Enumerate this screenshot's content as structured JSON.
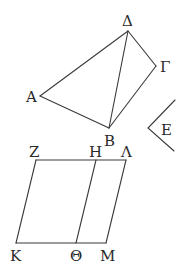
{
  "figure": {
    "top": {
      "points": {
        "A": {
          "x": 40,
          "y": 96,
          "label": "Α",
          "lx": 26,
          "ly": 102
        },
        "B": {
          "x": 109,
          "y": 128,
          "label": "Β",
          "lx": 104,
          "ly": 146
        },
        "G": {
          "x": 156,
          "y": 66,
          "label": "Γ",
          "lx": 160,
          "ly": 72
        },
        "D": {
          "x": 128,
          "y": 31,
          "label": "Δ",
          "lx": 122,
          "ly": 26
        }
      },
      "edges": [
        [
          "D",
          "A"
        ],
        [
          "A",
          "B"
        ],
        [
          "B",
          "G"
        ],
        [
          "G",
          "D"
        ],
        [
          "D",
          "B"
        ]
      ]
    },
    "angle": {
      "label": "Ε",
      "vertex": {
        "x": 148,
        "y": 128
      },
      "arm1": {
        "x": 175,
        "y": 100
      },
      "arm2": {
        "x": 174,
        "y": 151
      },
      "lx": 161,
      "ly": 135
    },
    "bottom": {
      "points": {
        "Z": {
          "x": 36,
          "y": 160,
          "label": "Ζ",
          "lx": 29,
          "ly": 157
        },
        "H": {
          "x": 96,
          "y": 160,
          "label": "Η",
          "lx": 89,
          "ly": 157
        },
        "L": {
          "x": 126,
          "y": 160,
          "label": "Λ",
          "lx": 121,
          "ly": 157
        },
        "K": {
          "x": 16,
          "y": 243,
          "label": "Κ",
          "lx": 10,
          "ly": 261
        },
        "TH": {
          "x": 76,
          "y": 243,
          "label": "Θ",
          "lx": 70,
          "ly": 261
        },
        "M": {
          "x": 106,
          "y": 243,
          "label": "Μ",
          "lx": 100,
          "ly": 261
        }
      },
      "edges": [
        [
          "Z",
          "L"
        ],
        [
          "K",
          "M"
        ],
        [
          "Z",
          "K"
        ],
        [
          "H",
          "TH"
        ],
        [
          "L",
          "M"
        ]
      ]
    },
    "labels": {
      "A": "Α",
      "B": "Β",
      "G": "Γ",
      "D": "Δ",
      "E": "Ε",
      "Z": "Ζ",
      "H": "Η",
      "L": "Λ",
      "K": "Κ",
      "TH": "Θ",
      "M": "Μ"
    }
  }
}
